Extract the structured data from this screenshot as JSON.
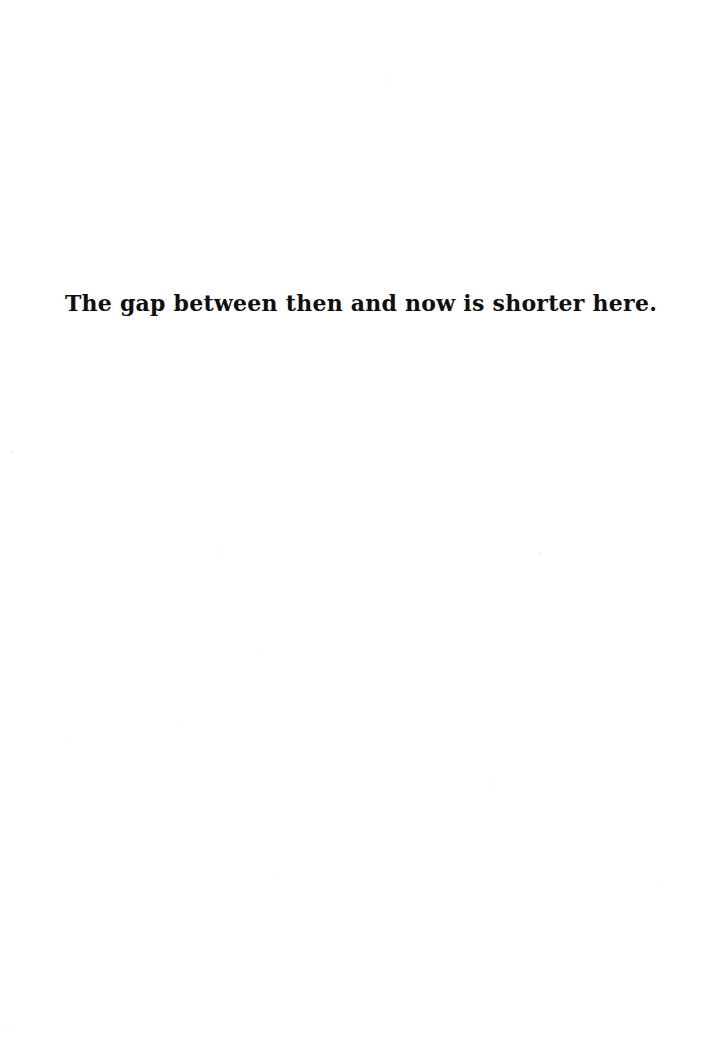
{
  "page": {
    "kind": "scanned-book-page",
    "background_color": "#ffffff",
    "width": 722,
    "height": 1046
  },
  "content": {
    "epigraph": {
      "text": "The gap between then and now is shorter here.",
      "color": "#100f0f",
      "alignment": "center"
    }
  }
}
